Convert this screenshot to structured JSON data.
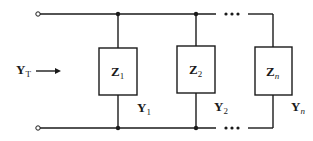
{
  "diagram": {
    "type": "parallel-admittance-circuit",
    "input": {
      "label": "Y",
      "subscript": "T",
      "arrow": "right-arrow"
    },
    "branches": [
      {
        "impedance": "Z",
        "impedance_sub": "1",
        "admittance": "Y",
        "admittance_sub": "1"
      },
      {
        "impedance": "Z",
        "impedance_sub": "2",
        "admittance": "Y",
        "admittance_sub": "2"
      },
      {
        "impedance": "Z",
        "impedance_sub": "n",
        "admittance": "Y",
        "admittance_sub": "n"
      }
    ],
    "ellipsis": "•••",
    "colors": {
      "line": "#1a1a1a",
      "background": "#ffffff"
    }
  }
}
